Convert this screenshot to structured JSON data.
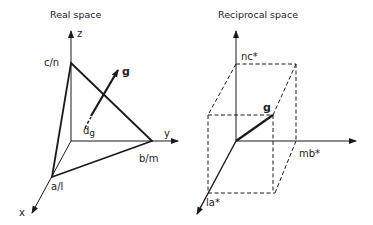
{
  "left_panel": {
    "title": "Real space",
    "labels": {
      "z": "z",
      "y": "y",
      "x": "x",
      "c": "c/n",
      "b": "b/m",
      "a": "a/l",
      "g": "g",
      "dg_main": "d",
      "dg_sub": "g"
    }
  },
  "right_panel": {
    "title": "Reciprocal space",
    "labels": {
      "nc": "nc*",
      "mb": "mb*",
      "la": "la*",
      "g": "g"
    }
  },
  "colors": {
    "line": "#1a1a1a",
    "text": "#222222",
    "background": "#ffffff"
  }
}
